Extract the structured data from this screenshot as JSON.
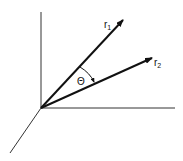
{
  "diagram": {
    "labels": {
      "vector1": "r",
      "vector1_sub": "1",
      "vector2": "r",
      "vector2_sub": "2",
      "angle": "Θ"
    },
    "colors": {
      "line": "#111111"
    }
  }
}
